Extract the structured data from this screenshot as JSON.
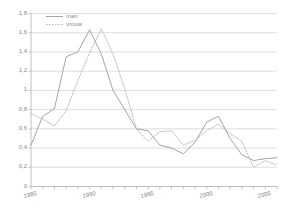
{
  "chart_data": {
    "type": "line",
    "title": "",
    "xlabel": "",
    "ylabel": "",
    "xlim": [
      1985,
      2006
    ],
    "ylim": [
      0,
      1.8
    ],
    "grid": true,
    "legend_position": "top-left",
    "x": [
      1985,
      1986,
      1987,
      1988,
      1989,
      1990,
      1991,
      1992,
      1993,
      1994,
      1995,
      1996,
      1997,
      1998,
      1999,
      2000,
      2001,
      2002,
      2003,
      2004,
      2005,
      2006
    ],
    "series": [
      {
        "name": "man",
        "style": "solid",
        "color": "#9a9a9a",
        "values": [
          0.43,
          0.73,
          0.81,
          1.35,
          1.4,
          1.63,
          1.38,
          1.0,
          0.8,
          0.6,
          0.58,
          0.43,
          0.4,
          0.34,
          0.46,
          0.67,
          0.73,
          0.5,
          0.33,
          0.27,
          0.29,
          0.3
        ]
      },
      {
        "name": "vrouw",
        "style": "dotted",
        "color": "#b5b5b5",
        "values": [
          0.76,
          0.7,
          0.63,
          0.79,
          1.1,
          1.39,
          1.64,
          1.38,
          1.02,
          0.6,
          0.47,
          0.57,
          0.58,
          0.43,
          0.48,
          0.58,
          0.65,
          0.55,
          0.47,
          0.2,
          0.27,
          0.22
        ]
      }
    ],
    "yticks": [
      "0",
      "0,2",
      "0,4",
      "0,6",
      "0,8",
      "1",
      "1,2",
      "1,4",
      "1,6",
      "1,8"
    ],
    "ytick_values": [
      0,
      0.2,
      0.4,
      0.6,
      0.8,
      1.0,
      1.2,
      1.4,
      1.6,
      1.8
    ],
    "xticks": [
      "1985",
      "1990",
      "1995",
      "2000",
      "2005"
    ],
    "xtick_values": [
      1985,
      1990,
      1995,
      2000,
      2005
    ],
    "xtick_minor_step": 1
  },
  "colors": {
    "axis": "#b0b0b0",
    "grid": "#c8c8c8",
    "text": "#8a8a8a",
    "series_man": "#9a9a9a",
    "series_vrouw": "#b5b5b5",
    "background": "#ffffff"
  }
}
